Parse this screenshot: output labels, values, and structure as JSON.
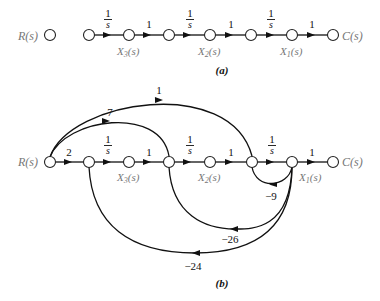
{
  "diagram_a": {
    "caption": "(a)",
    "input_label": "R(s)",
    "output_label": "C(s)",
    "branches": [
      {
        "gain_num": "1",
        "gain_den": "s",
        "label": "1/s"
      },
      {
        "gain": "1"
      },
      {
        "gain_num": "1",
        "gain_den": "s",
        "label": "1/s"
      },
      {
        "gain": "1"
      },
      {
        "gain_num": "1",
        "gain_den": "s",
        "label": "1/s"
      },
      {
        "gain": "1"
      }
    ],
    "state_labels": {
      "x3": "X3(s)",
      "x2": "X2(s)",
      "x1": "X1(s)"
    }
  },
  "diagram_b": {
    "caption": "(b)",
    "input_label": "R(s)",
    "output_label": "C(s)",
    "forward": [
      {
        "gain": "2"
      },
      {
        "gain_num": "1",
        "gain_den": "s",
        "label": "1/s"
      },
      {
        "gain": "1"
      },
      {
        "gain_num": "1",
        "gain_den": "s",
        "label": "1/s"
      },
      {
        "gain": "1"
      },
      {
        "gain_num": "1",
        "gain_den": "s",
        "label": "1/s"
      },
      {
        "gain": "1"
      }
    ],
    "feedforward": [
      {
        "gain": "1",
        "from": "R(s)",
        "to": "node 6"
      },
      {
        "gain": "7",
        "from": "R(s)",
        "to": "node 4"
      }
    ],
    "feedback": [
      {
        "gain": "-9",
        "from": "X1(s)",
        "to": "node 6"
      },
      {
        "gain": "-26",
        "from": "X1(s)",
        "to": "node 4"
      },
      {
        "gain": "-24",
        "from": "X1(s)",
        "to": "node 2"
      }
    ],
    "state_labels": {
      "x3": "X3(s)",
      "x2": "X2(s)",
      "x1": "X1(s)"
    }
  },
  "text": {
    "one": "1",
    "s": "s",
    "two": "2",
    "seven": "7",
    "neg9": "−9",
    "neg26": "−26",
    "neg24": "−24",
    "R": "R",
    "C": "C",
    "X": "X",
    "sub1": "1",
    "sub2": "2",
    "sub3": "3",
    "paren_s": "(s)"
  }
}
